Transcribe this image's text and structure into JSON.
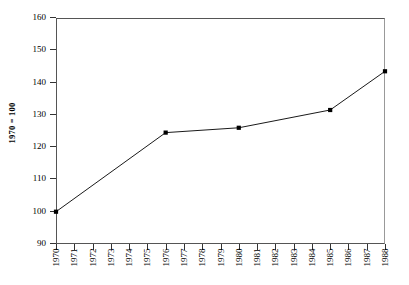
{
  "chart_data": {
    "type": "line",
    "title": "",
    "subtitle": "",
    "xlabel": "",
    "ylabel": "1970 = 100",
    "xlim": [
      1970,
      1988
    ],
    "ylim": [
      90,
      160
    ],
    "grid": false,
    "legend": false,
    "yticks": [
      90,
      100,
      110,
      120,
      130,
      140,
      150,
      160
    ],
    "ytick_labels": [
      "90",
      "100",
      "110",
      "120",
      "130",
      "140",
      "150",
      "160"
    ],
    "xticks": [
      1970,
      1971,
      1972,
      1973,
      1974,
      1975,
      1976,
      1977,
      1978,
      1979,
      1980,
      1981,
      1982,
      1983,
      1984,
      1985,
      1986,
      1987,
      1988
    ],
    "xtick_labels": [
      "1970",
      "1971",
      "1972",
      "1973",
      "1974",
      "1975",
      "1976",
      "1977",
      "1978",
      "1979",
      "1980",
      "1981",
      "1982",
      "1983",
      "1984",
      "1985",
      "1986",
      "1987",
      "1988"
    ],
    "x": [
      1970,
      1976,
      1980,
      1985,
      1988
    ],
    "values": [
      100,
      124.5,
      126,
      131.5,
      143.5
    ],
    "marker": "square",
    "marker_color": "#000000",
    "line_color": "#1a1a1a",
    "line_width": 1,
    "background_color": "#ffffff",
    "axis_color": "#333333"
  }
}
